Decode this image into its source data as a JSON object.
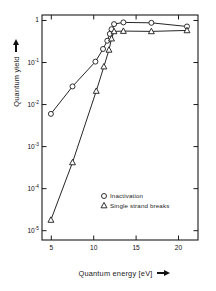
{
  "chart_data": {
    "type": "scatter",
    "title": "",
    "subtitle": "",
    "xlabel": "Quantum energy [eV]",
    "ylabel": "Quantum yield",
    "xlabel_arrow": "right-arrow",
    "ylabel_arrow": "up-arrow",
    "xscale": "linear",
    "yscale": "log",
    "xlim": [
      3.9,
      22.3
    ],
    "ylim": [
      6e-06,
      1.35
    ],
    "grid": false,
    "frame": "box",
    "xticks": [
      5,
      10,
      15,
      20
    ],
    "xticklabels": [
      "5",
      "10",
      "15",
      "20"
    ],
    "yticks": [
      1,
      0.1,
      0.01,
      0.001,
      0.0001,
      1e-05
    ],
    "yticklabels": [
      "1",
      "10-1",
      "10-2",
      "10-3",
      "10-4",
      "10-5"
    ],
    "yticklabels_display": [
      {
        "mantissa": "1",
        "exponent": ""
      },
      {
        "mantissa": "10",
        "exponent": "-1"
      },
      {
        "mantissa": "10",
        "exponent": "-2"
      },
      {
        "mantissa": "10",
        "exponent": "-3"
      },
      {
        "mantissa": "10",
        "exponent": "-4"
      },
      {
        "mantissa": "10",
        "exponent": "-5"
      }
    ],
    "legend_position": "lower-right-inside",
    "series": [
      {
        "name": "Inactivation",
        "marker": "circle",
        "color": "#1a1a1a",
        "x": [
          4.95,
          7.5,
          10.2,
          11.1,
          11.6,
          11.9,
          12.1,
          12.4,
          13.5,
          16.8,
          21.0
        ],
        "y": [
          0.006,
          0.027,
          0.105,
          0.21,
          0.33,
          0.48,
          0.62,
          0.82,
          0.9,
          0.88,
          0.72
        ]
      },
      {
        "name": "Single strand breaks",
        "marker": "triangle",
        "color": "#1a1a1a",
        "x": [
          4.95,
          7.5,
          10.3,
          11.2,
          11.8,
          12.1,
          12.4,
          13.5,
          16.8,
          21.0
        ],
        "y": [
          1.8e-05,
          0.00042,
          0.021,
          0.08,
          0.2,
          0.37,
          0.55,
          0.56,
          0.55,
          0.58
        ]
      }
    ],
    "legend": [
      {
        "label": "Inactivation",
        "marker": "circle"
      },
      {
        "label": "Single strand breaks",
        "marker": "triangle"
      }
    ]
  }
}
